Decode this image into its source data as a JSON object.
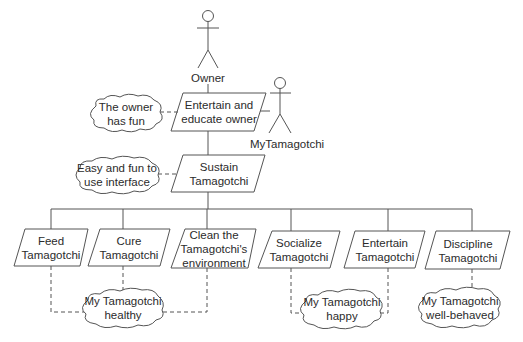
{
  "actors": {
    "owner": {
      "label": "Owner"
    },
    "mytamagotchi": {
      "label": "MyTamagotchi"
    }
  },
  "goals": {
    "entertain_owner": {
      "line1": "Entertain and",
      "line2": "educate owner"
    },
    "sustain": {
      "line1": "Sustain",
      "line2": "Tamagotchi"
    },
    "feed": {
      "line1": "Feed",
      "line2": "Tamagotchi"
    },
    "cure": {
      "line1": "Cure",
      "line2": "Tamagotchi"
    },
    "clean": {
      "line1": "Clean the",
      "line2": "Tamagotchi's",
      "line3": "environment"
    },
    "socialize": {
      "line1": "Socialize",
      "line2": "Tamagotchi"
    },
    "entertain": {
      "line1": "Entertain",
      "line2": "Tamagotchi"
    },
    "discipline": {
      "line1": "Discipline",
      "line2": "Tamagotchi"
    }
  },
  "softgoals": {
    "owner_fun": {
      "line1": "The owner",
      "line2": "has fun"
    },
    "easy_interface": {
      "line1": "Easy and fun to",
      "line2": "use interface"
    },
    "healthy": {
      "line1": "My Tamagotchi",
      "line2": "healthy"
    },
    "happy": {
      "line1": "My Tamagotchi",
      "line2": "happy"
    },
    "well_behaved": {
      "line1": "My Tamagotchi",
      "line2": "well-behaved"
    }
  }
}
